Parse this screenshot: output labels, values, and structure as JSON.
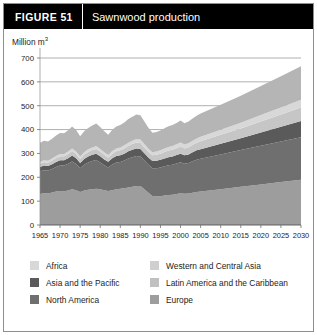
{
  "figure": {
    "number_label": "FIGURE  51",
    "title": "Sawnwood production"
  },
  "chart_data": {
    "type": "area",
    "stacked": true,
    "title": "Sawnwood production",
    "xlabel": "",
    "ylabel": "Million m³",
    "ylim": [
      0,
      700
    ],
    "xlim": [
      1965,
      2030
    ],
    "grid": true,
    "gridlines": [
      400,
      500,
      600,
      700
    ],
    "yticks": [
      0,
      100,
      200,
      300,
      400,
      500,
      600,
      700
    ],
    "xticks": [
      1965,
      1970,
      1975,
      1980,
      1985,
      1990,
      1995,
      2000,
      2005,
      2010,
      2015,
      2020,
      2025,
      2030
    ],
    "legend_position": "bottom",
    "x": [
      1965,
      1966,
      1967,
      1968,
      1969,
      1970,
      1971,
      1972,
      1973,
      1974,
      1975,
      1976,
      1977,
      1978,
      1979,
      1980,
      1981,
      1982,
      1983,
      1984,
      1985,
      1986,
      1987,
      1988,
      1989,
      1990,
      1991,
      1992,
      1993,
      1994,
      1995,
      1996,
      1997,
      1998,
      1999,
      2000,
      2001,
      2002,
      2003,
      2004,
      2005,
      2010,
      2015,
      2020,
      2025,
      2030
    ],
    "series": [
      {
        "name": "Europe",
        "color": "#9d9d9d",
        "values": [
          130,
          133,
          132,
          136,
          140,
          143,
          141,
          145,
          150,
          146,
          138,
          145,
          148,
          150,
          152,
          150,
          146,
          143,
          146,
          150,
          152,
          154,
          157,
          160,
          163,
          163,
          150,
          135,
          122,
          120,
          121,
          124,
          126,
          127,
          130,
          133,
          131,
          132,
          135,
          138,
          140,
          150,
          160,
          170,
          180,
          190
        ]
      },
      {
        "name": "North America",
        "color": "#6f6f6f",
        "values": [
          95,
          97,
          96,
          99,
          103,
          106,
          108,
          112,
          116,
          110,
          100,
          108,
          114,
          118,
          120,
          112,
          104,
          98,
          108,
          112,
          112,
          116,
          122,
          124,
          126,
          124,
          120,
          118,
          116,
          118,
          120,
          122,
          124,
          126,
          128,
          130,
          126,
          128,
          132,
          136,
          138,
          146,
          154,
          162,
          170,
          178
        ]
      },
      {
        "name": "Asia and the Pacific",
        "color": "#5a5a5a",
        "values": [
          18,
          19,
          19,
          20,
          21,
          22,
          22,
          23,
          25,
          24,
          22,
          24,
          25,
          26,
          27,
          26,
          25,
          24,
          26,
          27,
          28,
          29,
          30,
          31,
          32,
          32,
          31,
          30,
          30,
          31,
          32,
          33,
          34,
          34,
          35,
          36,
          35,
          36,
          38,
          39,
          40,
          45,
          50,
          56,
          62,
          68
        ]
      },
      {
        "name": "Latin America and the Caribbean",
        "color": "#c6c6c6",
        "values": [
          14,
          14,
          14,
          15,
          16,
          17,
          17,
          18,
          19,
          18,
          17,
          18,
          19,
          20,
          20,
          20,
          19,
          18,
          19,
          20,
          21,
          22,
          23,
          24,
          25,
          25,
          24,
          24,
          24,
          25,
          26,
          27,
          28,
          28,
          29,
          30,
          29,
          30,
          31,
          32,
          33,
          37,
          41,
          46,
          51,
          56
        ]
      },
      {
        "name": "Western and Central Asia",
        "color": "#d8d8d8",
        "values": [
          8,
          8,
          8,
          9,
          9,
          10,
          10,
          10,
          11,
          10,
          10,
          10,
          11,
          11,
          12,
          11,
          11,
          10,
          11,
          12,
          12,
          13,
          13,
          14,
          14,
          14,
          14,
          13,
          13,
          14,
          14,
          15,
          15,
          16,
          16,
          17,
          16,
          17,
          17,
          18,
          19,
          21,
          24,
          27,
          30,
          33
        ]
      },
      {
        "name": "Africa",
        "color": "#b5b5b5",
        "values": [
          80,
          82,
          81,
          83,
          86,
          88,
          87,
          89,
          92,
          90,
          85,
          88,
          90,
          92,
          94,
          92,
          88,
          85,
          89,
          92,
          94,
          96,
          99,
          101,
          103,
          102,
          95,
          88,
          82,
          82,
          83,
          85,
          87,
          88,
          90,
          92,
          90,
          91,
          93,
          95,
          97,
          105,
          113,
          122,
          131,
          140
        ]
      }
    ],
    "band_order_bottom_to_top": [
      "Europe",
      "North America",
      "Asia and the Pacific",
      "Latin America and the Caribbean",
      "Western and Central Asia",
      "Africa"
    ]
  },
  "legend": {
    "column1": [
      {
        "label": "Africa",
        "color": "#d8d8d8"
      },
      {
        "label": "Asia and the Pacific",
        "color": "#5a5a5a"
      },
      {
        "label": "North America",
        "color": "#6f6f6f"
      }
    ],
    "column2": [
      {
        "label": "Western and Central Asia",
        "color": "#cfcfcf"
      },
      {
        "label": "Latin America and the Caribbean",
        "color": "#c0c0c0"
      },
      {
        "label": "Europe",
        "color": "#9d9d9d"
      }
    ]
  },
  "colors": {
    "header_bg": "#000000",
    "header_fg": "#ffffff",
    "frame": "#8e8e8e",
    "axis": "#7a7a7a",
    "text": "#1c1c1c"
  }
}
